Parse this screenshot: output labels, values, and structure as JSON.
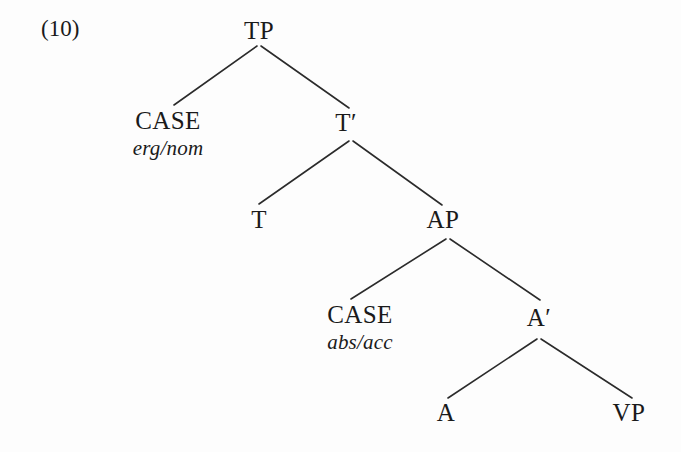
{
  "figure": {
    "example_number": "(10)",
    "text_color": "#1a1a1a",
    "background_color": "#fdfdfd",
    "line_color": "#2b2b2b"
  },
  "tree": {
    "nodes": [
      {
        "id": "tp",
        "label": "TP",
        "gloss": "",
        "x": 259,
        "y": 18
      },
      {
        "id": "case1",
        "label": "CASE",
        "gloss": "erg/nom",
        "x": 168,
        "y": 108
      },
      {
        "id": "tbar",
        "label": "T′",
        "gloss": "",
        "x": 346,
        "y": 110
      },
      {
        "id": "t",
        "label": "T",
        "gloss": "",
        "x": 259,
        "y": 207
      },
      {
        "id": "ap",
        "label": "AP",
        "gloss": "",
        "x": 443,
        "y": 207
      },
      {
        "id": "case2",
        "label": "CASE",
        "gloss": "abs/acc",
        "x": 360,
        "y": 302
      },
      {
        "id": "abar",
        "label": "A′",
        "gloss": "",
        "x": 539,
        "y": 305
      },
      {
        "id": "a",
        "label": "A",
        "gloss": "",
        "x": 446,
        "y": 400
      },
      {
        "id": "vp",
        "label": "VP",
        "gloss": "",
        "x": 629,
        "y": 400
      }
    ],
    "branches": [
      {
        "id": "tp-case1",
        "x1": 257,
        "y1": 46,
        "x2": 174,
        "y2": 105
      },
      {
        "id": "tp-tbar",
        "x1": 261,
        "y1": 46,
        "x2": 349,
        "y2": 108
      },
      {
        "id": "tbar-t",
        "x1": 349,
        "y1": 141,
        "x2": 259,
        "y2": 204
      },
      {
        "id": "tbar-ap",
        "x1": 353,
        "y1": 141,
        "x2": 442,
        "y2": 205
      },
      {
        "id": "ap-case2",
        "x1": 446,
        "y1": 239,
        "x2": 351,
        "y2": 299
      },
      {
        "id": "ap-abar",
        "x1": 450,
        "y1": 239,
        "x2": 540,
        "y2": 300
      },
      {
        "id": "abar-a",
        "x1": 537,
        "y1": 339,
        "x2": 448,
        "y2": 398
      },
      {
        "id": "abar-vp",
        "x1": 541,
        "y1": 339,
        "x2": 632,
        "y2": 398
      }
    ]
  }
}
